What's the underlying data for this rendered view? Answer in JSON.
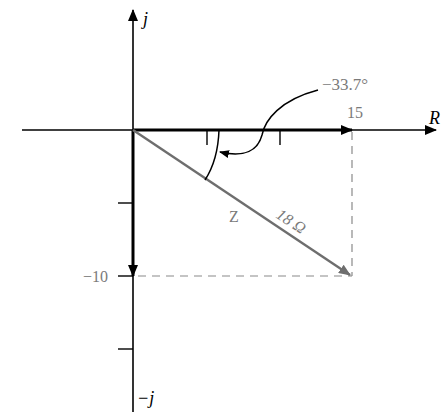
{
  "diagram": {
    "type": "phasor-impedance-diagram",
    "axes": {
      "real_label": "R",
      "imag_pos_label": "j",
      "imag_neg_label": "−j"
    },
    "labels": {
      "angle": "−33.7°",
      "resistance_value": "15",
      "reactance_value": "−10",
      "impedance_name": "Z",
      "impedance_magnitude": "18 Ω"
    },
    "colors": {
      "axis": "#000000",
      "vector_r": "#000000",
      "vector_x": "#000000",
      "vector_z": "#6e6e6e",
      "dashed": "#8a8a8a",
      "label_gray": "#7a7a7a"
    },
    "values": {
      "R": 15,
      "X": -10,
      "Z_magnitude": 18,
      "angle_deg": -33.7
    }
  }
}
